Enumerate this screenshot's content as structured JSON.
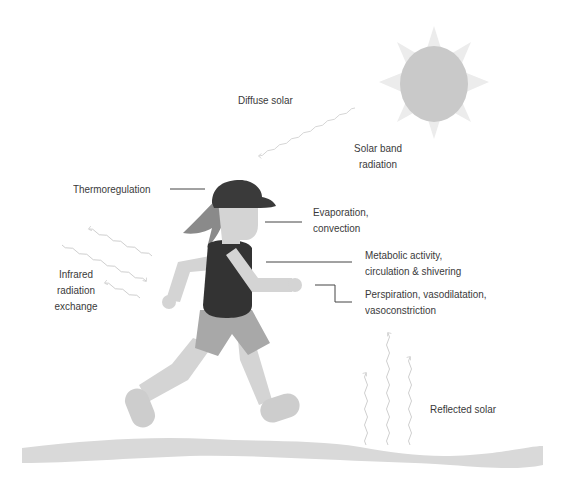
{
  "diagram": {
    "type": "illustration",
    "colors": {
      "background": "#ffffff",
      "sun": "#c9c9c9",
      "sun_rays": "#ececec",
      "cap": "#3a3a3a",
      "shirt": "#333333",
      "hair": "#8a8a8a",
      "skin": "#d4d4d4",
      "shorts": "#a8a8a8",
      "ground": "#d9d9d9",
      "wave_arrow": "#cfcfcf",
      "leader_line": "#444444",
      "text": "#3a3a3a"
    },
    "labels": {
      "diffuse_solar": "Diffuse solar",
      "solar_band_line1": "Solar band",
      "solar_band_line2": "radiation",
      "thermoregulation": "Thermoregulation",
      "evaporation_line1": "Evaporation,",
      "evaporation_line2": "convection",
      "metabolic_line1": "Metabolic activity,",
      "metabolic_line2": "circulation & shivering",
      "perspiration_line1": "Perspiration, vasodilatation,",
      "perspiration_line2": "vasoconstriction",
      "infrared_line1": "Infrared",
      "infrared_line2": "radiation",
      "infrared_line3": "exchange",
      "reflected_solar": "Reflected solar"
    }
  }
}
